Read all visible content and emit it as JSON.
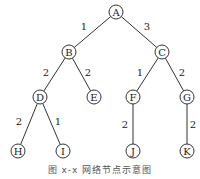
{
  "diagram": {
    "type": "weighted tree",
    "nodes": [
      {
        "id": "A",
        "x": 116,
        "y": 12
      },
      {
        "id": "B",
        "x": 69,
        "y": 52
      },
      {
        "id": "C",
        "x": 162,
        "y": 52
      },
      {
        "id": "D",
        "x": 40,
        "y": 97
      },
      {
        "id": "E",
        "x": 94,
        "y": 97
      },
      {
        "id": "F",
        "x": 133,
        "y": 97
      },
      {
        "id": "G",
        "x": 187,
        "y": 97
      },
      {
        "id": "H",
        "x": 18,
        "y": 151
      },
      {
        "id": "I",
        "x": 63,
        "y": 151
      },
      {
        "id": "J",
        "x": 133,
        "y": 151
      },
      {
        "id": "K",
        "x": 187,
        "y": 151
      }
    ],
    "edges": [
      {
        "from": "A",
        "to": "B",
        "weight": "1",
        "lx": 84,
        "ly": 26
      },
      {
        "from": "A",
        "to": "C",
        "weight": "3",
        "lx": 147,
        "ly": 26
      },
      {
        "from": "B",
        "to": "D",
        "weight": "2",
        "lx": 46,
        "ly": 72
      },
      {
        "from": "B",
        "to": "E",
        "weight": "2",
        "lx": 88,
        "ly": 72
      },
      {
        "from": "C",
        "to": "F",
        "weight": "1",
        "lx": 140,
        "ly": 72
      },
      {
        "from": "C",
        "to": "G",
        "weight": "2",
        "lx": 182,
        "ly": 72
      },
      {
        "from": "D",
        "to": "H",
        "weight": "2",
        "lx": 19,
        "ly": 121
      },
      {
        "from": "D",
        "to": "I",
        "weight": "1",
        "lx": 58,
        "ly": 121
      },
      {
        "from": "F",
        "to": "J",
        "weight": "2",
        "lx": 125,
        "ly": 124
      },
      {
        "from": "G",
        "to": "K",
        "weight": "2",
        "lx": 193,
        "ly": 124
      }
    ],
    "node_radius": 7
  },
  "caption": "图 x-x 网络节点示意图"
}
